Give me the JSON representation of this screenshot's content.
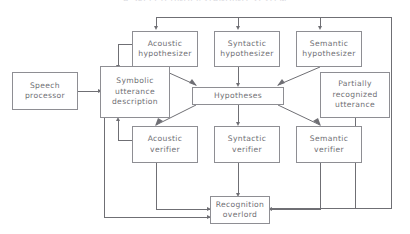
{
  "figure": {
    "title_cropped": "A SPEECH UNDERSTANDING SYSTEM",
    "type": "block-diagram",
    "background_color": "#ffffff",
    "line_color": "#6f6f74",
    "box_border_color": "#8e8e93",
    "text_color": "#6f6f74"
  },
  "nodes": {
    "speech_processor": {
      "line1": "Speech",
      "line2": "processor",
      "line3": ""
    },
    "symbolic_utterance": {
      "line1": "Symbolic",
      "line2": "utterance",
      "line3": "description"
    },
    "acoustic_hyp": {
      "line1": "Acoustic",
      "line2": "hypothesizer",
      "line3": ""
    },
    "syntactic_hyp": {
      "line1": "Syntactic",
      "line2": "hypothesizer",
      "line3": ""
    },
    "semantic_hyp": {
      "line1": "Semantic",
      "line2": "hypothesizer",
      "line3": ""
    },
    "hypotheses": {
      "line1": "Hypotheses",
      "line2": "",
      "line3": ""
    },
    "partially_recognized": {
      "line1": "Partially",
      "line2": "recognized",
      "line3": "utterance"
    },
    "acoustic_ver": {
      "line1": "Acoustic",
      "line2": "verifier",
      "line3": ""
    },
    "syntactic_ver": {
      "line1": "Syntactic",
      "line2": "verifier",
      "line3": ""
    },
    "semantic_ver": {
      "line1": "Semantic",
      "line2": "verifier",
      "line3": ""
    },
    "recognition_overlord": {
      "line1": "Recognition",
      "line2": "overlord",
      "line3": ""
    }
  }
}
